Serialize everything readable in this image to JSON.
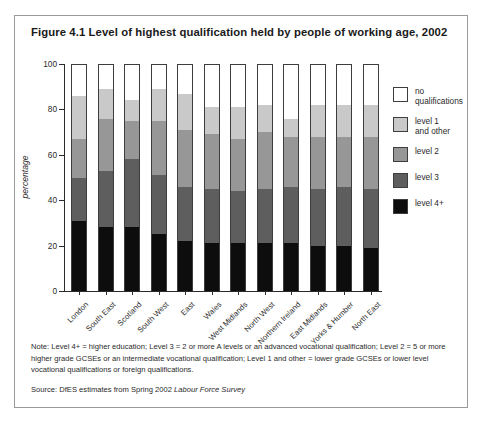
{
  "figure": {
    "title": "Figure 4.1 Level of highest qualification held by people of working age, 2002",
    "note": "Note: Level 4+ = higher education; Level 3 = 2 or more A levels or an advanced vocational qualification; Level 2 = 5 or more higher grade GCSEs or an intermediate vocational qualification; Level 1 and other = lower grade GCSEs or lower level vocational qualifications or foreign qualifications.",
    "source_prefix": "Source: DfES estimates from Spring 2002 ",
    "source_italic": "Labour Force Survey"
  },
  "legend": {
    "items": [
      {
        "label": "no\nqualifications",
        "color": "#ffffff",
        "key": "none"
      },
      {
        "label": "level 1\nand other",
        "color": "#c9c9c9",
        "key": "l1"
      },
      {
        "label": "level 2",
        "color": "#979797",
        "key": "l2"
      },
      {
        "label": "level 3",
        "color": "#5e5e5e",
        "key": "l3"
      },
      {
        "label": "level 4+",
        "color": "#0d0d0d",
        "key": "l4"
      }
    ]
  },
  "chart_data": {
    "type": "bar",
    "stacked": true,
    "title": "Figure 4.1 Level of highest qualification held by people of working age, 2002",
    "xlabel": "",
    "ylabel": "percentage",
    "ylim": [
      0,
      100
    ],
    "yticks": [
      0,
      20,
      40,
      60,
      80,
      100
    ],
    "grid": false,
    "legend_position": "right",
    "categories": [
      "London",
      "South East",
      "Scotland",
      "South West",
      "East",
      "Wales",
      "West Midlands",
      "North West",
      "Northern Ireland",
      "East Midlands",
      "Yorks & Humber",
      "North East"
    ],
    "series": [
      {
        "name": "level 4+",
        "color": "#0d0d0d",
        "values": [
          31,
          28,
          28,
          25,
          22,
          21,
          21,
          21,
          21,
          20,
          20,
          19
        ]
      },
      {
        "name": "level 3",
        "color": "#5e5e5e",
        "values": [
          19,
          25,
          30,
          26,
          24,
          24,
          23,
          24,
          25,
          25,
          26,
          26
        ]
      },
      {
        "name": "level 2",
        "color": "#979797",
        "values": [
          17,
          23,
          17,
          24,
          25,
          24,
          23,
          25,
          22,
          23,
          22,
          23
        ]
      },
      {
        "name": "level 1 and other",
        "color": "#c9c9c9",
        "values": [
          19,
          13,
          9,
          14,
          16,
          12,
          14,
          12,
          8,
          14,
          14,
          14
        ]
      },
      {
        "name": "no qualifications",
        "color": "#ffffff",
        "values": [
          14,
          11,
          16,
          11,
          13,
          19,
          19,
          18,
          24,
          18,
          18,
          18
        ]
      }
    ],
    "cumulative_tops": {
      "level_4_plus": [
        31,
        28,
        28,
        25,
        22,
        21,
        21,
        21,
        21,
        20,
        20,
        19
      ],
      "through_level_3": [
        50,
        53,
        58,
        51,
        46,
        45,
        44,
        45,
        46,
        45,
        46,
        45
      ],
      "through_level_2": [
        67,
        76,
        75,
        75,
        71,
        69,
        67,
        70,
        68,
        68,
        68,
        68
      ],
      "through_level_1_other": [
        86,
        89,
        84,
        89,
        87,
        81,
        81,
        82,
        76,
        82,
        82,
        82
      ],
      "total": [
        100,
        100,
        100,
        100,
        100,
        100,
        100,
        100,
        100,
        100,
        100,
        100
      ]
    }
  }
}
